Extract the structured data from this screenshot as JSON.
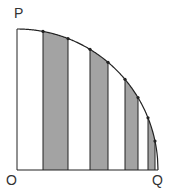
{
  "labels": {
    "P": "P",
    "O": "O",
    "Q": "Q"
  },
  "colors": {
    "stroke": "#222222",
    "shade": "#a3a3a3",
    "background": "#ffffff"
  },
  "geometry": {
    "origin": [
      17,
      170
    ],
    "radius": 141,
    "strip_edges_x": [
      17,
      43,
      68,
      90,
      108,
      125,
      138,
      148,
      155,
      158
    ],
    "shaded_strips": [
      [
        43,
        68
      ],
      [
        90,
        108
      ],
      [
        125,
        138
      ],
      [
        148,
        155
      ]
    ]
  }
}
